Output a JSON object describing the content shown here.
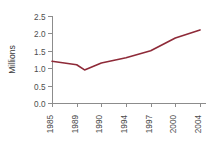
{
  "chart_data": {
    "type": "line",
    "title": "",
    "subtitle": "",
    "xlabel": "",
    "ylabel": "Millions",
    "categories": [
      "1985",
      "1989",
      "1990",
      "1994",
      "1997",
      "2000",
      "2004"
    ],
    "series": [
      {
        "name": "Millions",
        "color": "#8e2a38",
        "values": [
          1.2,
          1.1,
          1.15,
          1.3,
          1.5,
          1.87,
          2.1
        ]
      }
    ],
    "interior_points": [
      {
        "label": "trough",
        "x_fraction": 0.22,
        "value": 0.95
      }
    ],
    "ylim": [
      0.0,
      2.5
    ],
    "yticks": [
      "0.0",
      "0.5",
      "1.0",
      "1.5",
      "2.0",
      "2.5"
    ],
    "ytick_values": [
      0.0,
      0.5,
      1.0,
      1.5,
      2.0,
      2.5
    ],
    "grid": false,
    "legend": false,
    "legend_position": "none",
    "xtick_rotation": -90,
    "axis_color": "#8c8c8c",
    "text_color": "#4d4d4d",
    "background_color": "#ffffff"
  },
  "axes_geometry": {
    "plot_left": 52,
    "plot_right": 200,
    "plot_top": 16,
    "plot_bottom": 103,
    "tick_length": 4,
    "xlabel_offset": 8
  }
}
